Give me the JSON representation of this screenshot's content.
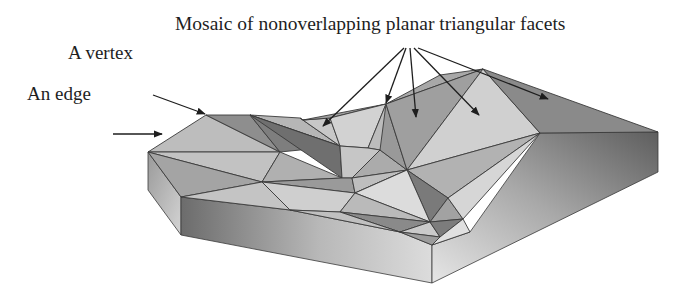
{
  "labels": {
    "title": "Mosaic of nonoverlapping planar triangular facets",
    "vertex": "A vertex",
    "edge": "An edge"
  },
  "colors": {
    "line": "#3a3a3a",
    "text": "#1e1e1e",
    "facet_light": "#d8d8d8",
    "facet_mid": "#b4b4b4",
    "facet_dark": "#8c8c8c",
    "side_dark": "#6e6e6e",
    "side_light": "#e2e2e2"
  },
  "annotations": [
    {
      "text": "A vertex",
      "points_to": [
        206,
        115
      ]
    },
    {
      "text": "An edge",
      "points_to": [
        196,
        135
      ]
    },
    {
      "text": "Mosaic of nonoverlapping planar triangular facets",
      "arrow_count": 5
    }
  ]
}
